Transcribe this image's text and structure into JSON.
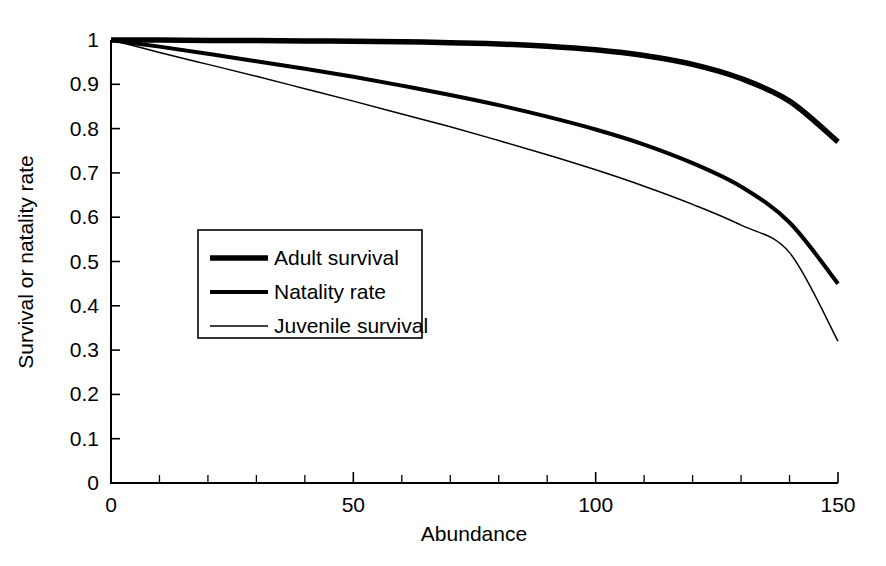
{
  "chart_data": {
    "type": "line",
    "title": "",
    "xlabel": "Abundance",
    "ylabel": "Survival or natality rate",
    "xlim": [
      0,
      150
    ],
    "ylim": [
      0,
      1
    ],
    "grid": false,
    "legend_position": "center-left",
    "x_ticks": [
      0,
      50,
      100,
      150
    ],
    "x_tick_labels": [
      "0",
      "50",
      "100",
      "150"
    ],
    "x_minor_tick_interval": 10,
    "y_ticks": [
      0,
      0.1,
      0.2,
      0.3,
      0.4,
      0.5,
      0.6,
      0.7,
      0.8,
      0.9,
      1
    ],
    "y_tick_labels": [
      "0",
      "0.1",
      "0.2",
      "0.3",
      "0.4",
      "0.5",
      "0.6",
      "0.7",
      "0.8",
      "0.9",
      "1"
    ],
    "x": [
      0,
      10,
      20,
      30,
      40,
      50,
      60,
      70,
      80,
      90,
      100,
      110,
      120,
      130,
      140,
      150
    ],
    "series": [
      {
        "name": "Adult survival",
        "line_width_px": 5.5,
        "color": "#000000",
        "values": [
          1.0,
          1.0,
          0.999,
          0.999,
          0.998,
          0.997,
          0.996,
          0.994,
          0.991,
          0.986,
          0.978,
          0.965,
          0.945,
          0.913,
          0.862,
          0.77
        ]
      },
      {
        "name": "Natality rate",
        "line_width_px": 4.0,
        "color": "#000000",
        "values": [
          1.0,
          0.985,
          0.969,
          0.952,
          0.935,
          0.917,
          0.897,
          0.876,
          0.853,
          0.827,
          0.798,
          0.764,
          0.722,
          0.669,
          0.588,
          0.45
        ]
      },
      {
        "name": "Juvenile survival",
        "line_width_px": 1.5,
        "color": "#000000",
        "values": [
          1.0,
          0.972,
          0.945,
          0.918,
          0.89,
          0.862,
          0.833,
          0.804,
          0.773,
          0.741,
          0.707,
          0.67,
          0.629,
          0.582,
          0.52,
          0.32
        ]
      }
    ]
  },
  "legend": {
    "items": [
      {
        "label": "Adult survival"
      },
      {
        "label": "Natality rate"
      },
      {
        "label": "Juvenile survival"
      }
    ]
  }
}
